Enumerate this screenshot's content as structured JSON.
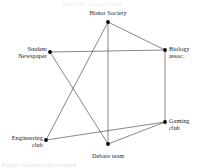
{
  "figure": {
    "ghost_text_top": "partially cropped line",
    "ghost_text_bottom": "Figure caption text cropped"
  },
  "chart_data": {
    "type": "scatter",
    "title": "",
    "xlabel": "",
    "ylabel": "",
    "grid": false,
    "legend": "none",
    "xlim": [
      0,
      203
    ],
    "ylim": [
      0,
      168
    ],
    "nodes": [
      {
        "id": "honor_society",
        "label": "Honor Society",
        "x": 108,
        "y": 22,
        "label_x": 108,
        "label_y": 9,
        "label_align": "center"
      },
      {
        "id": "student_newspaper",
        "label": "Student\nNewspaper",
        "x": 50,
        "y": 52,
        "label_x": 47,
        "label_y": 45,
        "label_align": "left"
      },
      {
        "id": "biology_assoc",
        "label": "Biology\nassoc.",
        "x": 165,
        "y": 50,
        "label_x": 169,
        "label_y": 45,
        "label_align": "right"
      },
      {
        "id": "gaming_club",
        "label": "Gaming\nclub",
        "x": 165,
        "y": 122,
        "label_x": 169,
        "label_y": 117,
        "label_align": "right"
      },
      {
        "id": "engineering_club",
        "label": "Engineering\nclub",
        "x": 46,
        "y": 140,
        "label_x": 43,
        "label_y": 134,
        "label_align": "left"
      },
      {
        "id": "debate_team",
        "label": "Debate team",
        "x": 108,
        "y": 144,
        "label_x": 108,
        "label_y": 152,
        "label_align": "center"
      }
    ],
    "edges": [
      {
        "source": "honor_society",
        "target": "biology_assoc"
      },
      {
        "source": "honor_society",
        "target": "debate_team"
      },
      {
        "source": "honor_society",
        "target": "engineering_club"
      },
      {
        "source": "student_newspaper",
        "target": "biology_assoc"
      },
      {
        "source": "student_newspaper",
        "target": "debate_team"
      },
      {
        "source": "biology_assoc",
        "target": "gaming_club"
      },
      {
        "source": "engineering_club",
        "target": "gaming_club"
      },
      {
        "source": "debate_team",
        "target": "gaming_club"
      }
    ],
    "colors": {
      "node": "#000000",
      "edge": "#555555",
      "label": "#1a1a1a",
      "background": "#ffffff"
    }
  }
}
